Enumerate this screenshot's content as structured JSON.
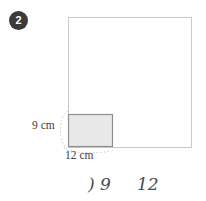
{
  "question": {
    "number": "2"
  },
  "figure": {
    "outer_square": {
      "name": "large-square",
      "x": 68,
      "y": 17,
      "width": 123,
      "height": 130,
      "fill": "#ffffff",
      "stroke": "#c9c9c9"
    },
    "inner_rectangle": {
      "name": "shaded-rectangle",
      "x": 68,
      "y": 114,
      "width": 44,
      "height": 33,
      "fill": "#e8e8e8",
      "stroke": "#8f8f8f"
    },
    "arc_guides": {
      "stroke": "#c4c4c4",
      "dash": "1.5 2"
    }
  },
  "labels": {
    "height": "9 cm",
    "width": "12 cm"
  },
  "handwriting": {
    "first": ") 9",
    "second": "12",
    "color": "#4a4a4a"
  },
  "colors": {
    "badge_background": "#3b3b3b",
    "badge_text": "#ffffff",
    "page_background": "#ffffff",
    "label_text": "#3d3d3d"
  }
}
